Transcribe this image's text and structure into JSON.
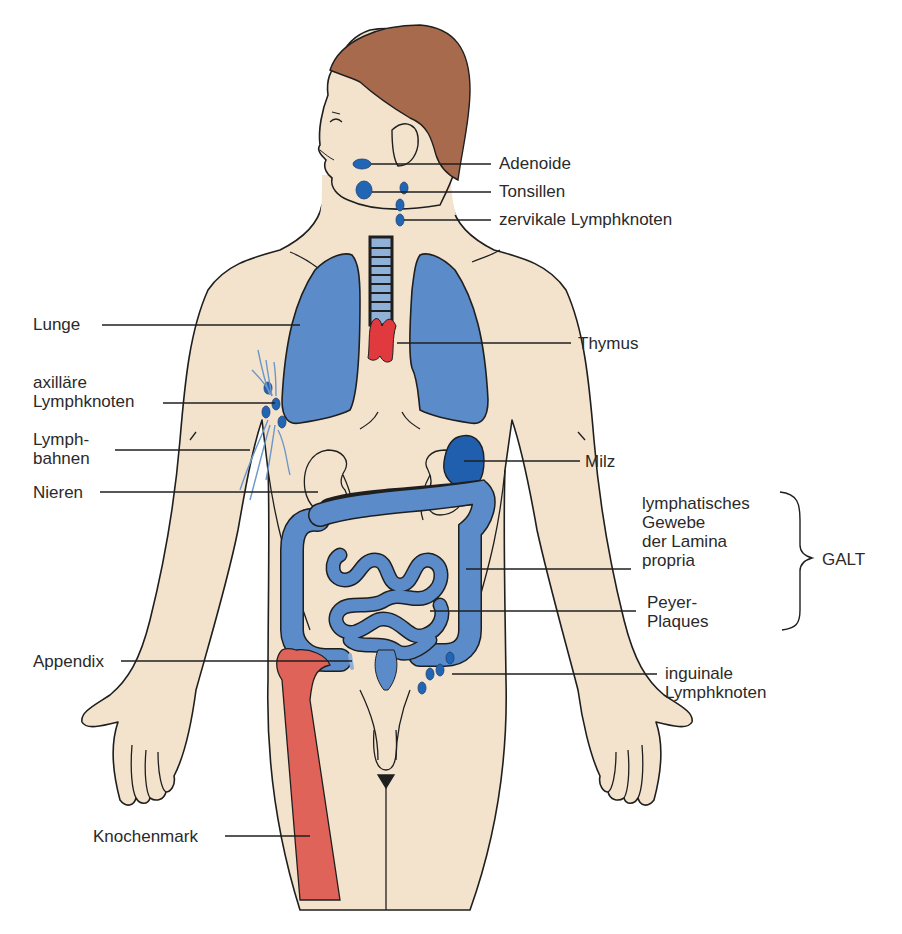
{
  "figure": {
    "title": "",
    "colors": {
      "skin": "#f3e3cd",
      "outline": "#1f1f1f",
      "hair": "#a86a4c",
      "lymph_blue": "#5b8cc9",
      "lymph_dark_blue": "#2066b4",
      "spleen": "#1f5fae",
      "thymus_red": "#e03a3e",
      "bone_red": "#e0635a",
      "trachea": "#8fb1d8",
      "label_text": "#2a2a2a"
    }
  },
  "labels": {
    "adenoide": "Adenoide",
    "tonsillen": "Tonsillen",
    "zervikale": "zervikale Lymphknoten",
    "lunge": "Lunge",
    "thymus": "Thymus",
    "axillaere_1": "axilläre",
    "axillaere_2": "Lymphknoten",
    "lymphbahnen_1": "Lymph-",
    "lymphbahnen_2": "bahnen",
    "milz": "Milz",
    "nieren": "Nieren",
    "lamina_1": "lymphatisches",
    "lamina_2": "Gewebe",
    "lamina_3": "der Lamina",
    "lamina_4": "propria",
    "galt": "GALT",
    "peyer_1": "Peyer-",
    "peyer_2": "Plaques",
    "appendix": "Appendix",
    "inguinale_1": "inguinale",
    "inguinale_2": "Lymphknoten",
    "knochenmark": "Knochenmark"
  }
}
